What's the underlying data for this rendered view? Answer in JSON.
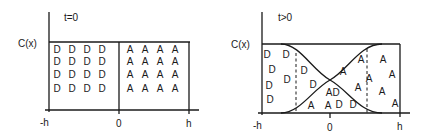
{
  "panels": [
    {
      "id": "t-zero",
      "time_label": "t=0",
      "y_label": "C(x)",
      "x_ticks": [
        "-h",
        "0",
        "h"
      ],
      "particles_D": [
        [
          57,
          53
        ],
        [
          72,
          53
        ],
        [
          87,
          53
        ],
        [
          102,
          53
        ],
        [
          57,
          65
        ],
        [
          72,
          65
        ],
        [
          87,
          65
        ],
        [
          102,
          65
        ],
        [
          57,
          78
        ],
        [
          72,
          78
        ],
        [
          87,
          78
        ],
        [
          102,
          78
        ],
        [
          57,
          92
        ],
        [
          72,
          92
        ],
        [
          87,
          92
        ],
        [
          102,
          92
        ]
      ],
      "particles_A": [
        [
          130,
          53
        ],
        [
          145,
          53
        ],
        [
          160,
          53
        ],
        [
          175,
          53
        ],
        [
          130,
          65
        ],
        [
          145,
          65
        ],
        [
          160,
          65
        ],
        [
          175,
          65
        ],
        [
          130,
          78
        ],
        [
          145,
          78
        ],
        [
          160,
          78
        ],
        [
          175,
          78
        ],
        [
          130,
          92
        ],
        [
          145,
          92
        ],
        [
          160,
          92
        ],
        [
          175,
          92
        ]
      ]
    },
    {
      "id": "t-positive",
      "time_label": "t>0",
      "y_label": "C(x)",
      "x_ticks": [
        "-h",
        "0",
        "h"
      ],
      "particles_D": [
        [
          267,
          58
        ],
        [
          286,
          58
        ],
        [
          272,
          73
        ],
        [
          287,
          83
        ],
        [
          269,
          89
        ],
        [
          270,
          103
        ],
        [
          304,
          74
        ],
        [
          313,
          88
        ],
        [
          336,
          96
        ],
        [
          339,
          108
        ],
        [
          353,
          108
        ]
      ],
      "particles_A": [
        [
          361,
          63
        ],
        [
          383,
          63
        ],
        [
          343,
          75
        ],
        [
          369,
          82
        ],
        [
          392,
          78
        ],
        [
          358,
          91
        ],
        [
          382,
          95
        ],
        [
          329,
          96
        ],
        [
          311,
          109
        ],
        [
          328,
          109
        ],
        [
          395,
          107
        ]
      ]
    }
  ],
  "legend": {
    "D": "D",
    "A": "A"
  }
}
